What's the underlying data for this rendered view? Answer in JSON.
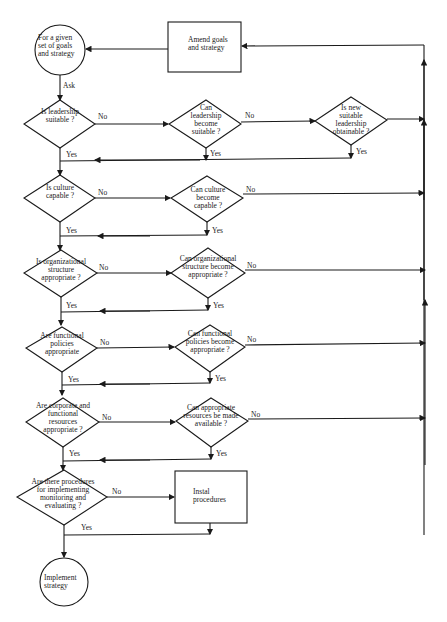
{
  "start": {
    "label": "For a given set of goals and strategy"
  },
  "amend": {
    "label": "Amend goals and strategy"
  },
  "ask": "Ask",
  "yes": "Yes",
  "no": "No",
  "q1": {
    "main": "Is leadership suitable ?",
    "alt": "Can leadership become suitable ?",
    "alt2": "Is new suitable leadership obtainable ?"
  },
  "q2": {
    "main": "Is culture capable ?",
    "alt": "Can culture become capable ?"
  },
  "q3": {
    "main": "Is organizational structure appropriate ?",
    "alt": "Can organizational structure become appropriate ?"
  },
  "q4": {
    "main": "Are functional policies appropriate",
    "alt": "Can functional policies become appropriate ?"
  },
  "q5": {
    "main": "Are corporate and functional resources appropriate ?",
    "alt": "Can appropriate resources be made available ?"
  },
  "q6": {
    "main": "Are there procedures for implementing monitoring and evaluating ?"
  },
  "install": {
    "label": "Instal procedures"
  },
  "end": {
    "label": "Implement strategy"
  }
}
